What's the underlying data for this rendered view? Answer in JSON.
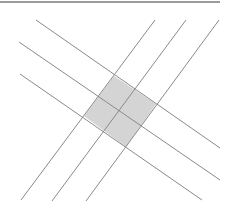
{
  "diagram": {
    "width": 232,
    "height": 212,
    "colors": {
      "line": "#8a8a8a",
      "top_rule": "#7a7a7a",
      "shade": "#d4d4d4",
      "background": "#ffffff"
    },
    "top_rule": {
      "x1": 0,
      "y1": 2,
      "x2": 220,
      "y2": 2
    },
    "nw_se_lines": [
      {
        "x1": 36,
        "y1": 20,
        "x2": 220,
        "y2": 148
      },
      {
        "x1": 19,
        "y1": 42,
        "x2": 220,
        "y2": 180
      },
      {
        "x1": 20,
        "y1": 74,
        "x2": 202,
        "y2": 200
      }
    ],
    "ne_sw_lines": [
      {
        "x1": 155,
        "y1": 20,
        "x2": 21,
        "y2": 200
      },
      {
        "x1": 186,
        "y1": 20,
        "x2": 52,
        "y2": 201
      },
      {
        "x1": 219,
        "y1": 20,
        "x2": 86,
        "y2": 201
      }
    ],
    "shaded_region": {
      "points": "114,76 156,104 126,147 84,116",
      "description": "2x2 grid of shaded parallelograms at intersection of line families"
    }
  }
}
